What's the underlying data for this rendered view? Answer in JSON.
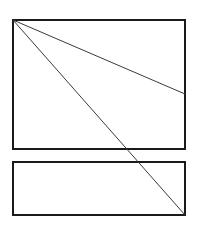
{
  "diagram": {
    "stroke_color": "#1a1a1a",
    "line_color": "#3a3a3a",
    "background": "#ffffff",
    "shapes": {
      "top_box": {
        "x": 13,
        "y": 20,
        "width": 172,
        "height": 129,
        "stroke_width": 2
      },
      "bottom_box": {
        "x": 13,
        "y": 162,
        "width": 172,
        "height": 53,
        "stroke_width": 2
      }
    },
    "lines": [
      {
        "name": "shallow-diagonal",
        "x1": 13,
        "y1": 20,
        "x2": 185,
        "y2": 94,
        "stroke_width": 1
      },
      {
        "name": "steep-diagonal",
        "x1": 13,
        "y1": 20,
        "x2": 185,
        "y2": 215,
        "stroke_width": 1
      }
    ]
  }
}
